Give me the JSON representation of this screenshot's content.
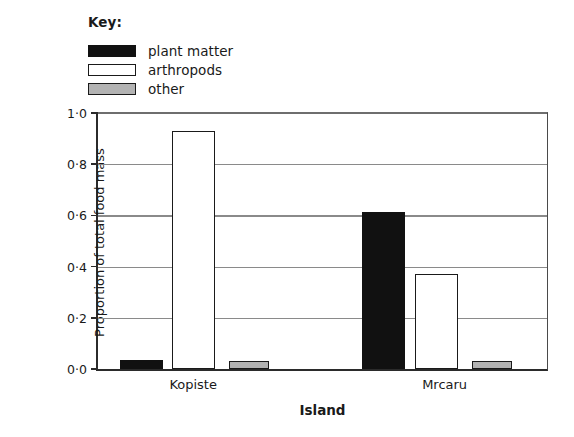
{
  "legend": {
    "title": "Key:",
    "items": [
      {
        "label": "plant matter",
        "color": "#111111",
        "border": "#111111",
        "key": "plant_matter"
      },
      {
        "label": "arthropods",
        "color": "#ffffff",
        "border": "#1a1a1a",
        "key": "arthropods"
      },
      {
        "label": "other",
        "color": "#b3b3b3",
        "border": "#1a1a1a",
        "key": "other"
      }
    ]
  },
  "chart_data": {
    "type": "bar",
    "title": "",
    "xlabel": "Island",
    "ylabel": "Proportion of total food mass",
    "categories": [
      "Kopiste",
      "Mrcaru"
    ],
    "series": [
      {
        "name": "plant matter",
        "color": "#111111",
        "values": [
          0.035,
          0.615
        ]
      },
      {
        "name": "arthropods",
        "color": "#ffffff",
        "values": [
          0.93,
          0.37
        ]
      },
      {
        "name": "other",
        "color": "#b3b3b3",
        "values": [
          0.03,
          0.03
        ]
      }
    ],
    "ylim": [
      0.0,
      1.0
    ],
    "yticks": [
      0.0,
      0.2,
      0.4,
      0.6,
      0.8,
      1.0
    ],
    "ytick_labels": [
      "0·0",
      "0·2",
      "0·4",
      "0·6",
      "0·8",
      "1·0"
    ],
    "grid": true,
    "legend_position": "top-left-outside"
  },
  "bar_layout": [
    {
      "name": "kopiste-plant-matter",
      "series": 0,
      "category": 0,
      "left_pct": 4.9,
      "width_pct": 9.5,
      "value": 0.035
    },
    {
      "name": "kopiste-arthropods",
      "series": 1,
      "category": 0,
      "left_pct": 16.4,
      "width_pct": 9.7,
      "value": 0.93
    },
    {
      "name": "kopiste-other",
      "series": 2,
      "category": 0,
      "left_pct": 29.2,
      "width_pct": 8.8,
      "value": 0.03
    },
    {
      "name": "mrcaru-plant-matter",
      "series": 0,
      "category": 1,
      "left_pct": 58.8,
      "width_pct": 9.5,
      "value": 0.615
    },
    {
      "name": "mrcaru-arthropods",
      "series": 1,
      "category": 1,
      "left_pct": 70.6,
      "width_pct": 9.5,
      "value": 0.37
    },
    {
      "name": "mrcaru-other",
      "series": 2,
      "category": 1,
      "left_pct": 83.2,
      "width_pct": 9.1,
      "value": 0.03
    }
  ],
  "category_positions_pct": [
    21.2,
    77.2
  ]
}
